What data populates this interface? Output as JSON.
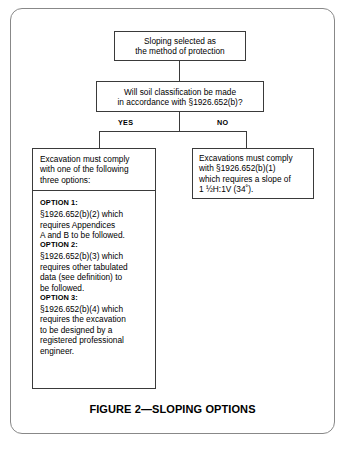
{
  "figure": {
    "caption": "FIGURE 2—SLOPING OPTIONS",
    "type": "flowchart",
    "frame_color": "#888888",
    "box_border_color": "#3a3a3a",
    "background_color": "#ffffff"
  },
  "nodes": {
    "start": {
      "text": "Sloping selected as\nthe method of protection"
    },
    "decision": {
      "text": "Will soil classification be made\nin accordance with §1926.652(b)?"
    },
    "yes_branch": {
      "label": "YES",
      "header": "Excavation must comply\nwith one of the following\nthree options:",
      "options": [
        {
          "title": "OPTION 1:",
          "body": "§1926.652(b)(2) which\nrequires Appendices\nA and B to be followed."
        },
        {
          "title": "OPTION 2:",
          "body": "§1926.652(b)(3) which\nrequires other tabulated\ndata (see definition) to\nbe followed."
        },
        {
          "title": "OPTION 3:",
          "body": "§1926.652(b)(4) which\nrequires the excavation\nto be designed by a\nregistered professional\nengineer."
        }
      ]
    },
    "no_branch": {
      "label": "NO",
      "text": "Excavations must comply\nwith §1926.652(b)(1)\nwhich requires a slope of\n1 ½H:1V (34˚)."
    }
  }
}
